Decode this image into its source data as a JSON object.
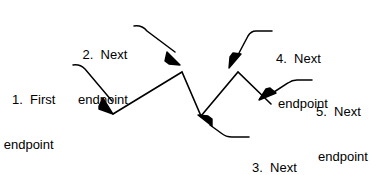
{
  "diagram": {
    "type": "polyline-construction-callout",
    "background_color": "#ffffff",
    "stroke_color": "#000000",
    "callouts": [
      {
        "id": "callout-1",
        "number": "1.",
        "line_a": "1.  First",
        "line_b": "endpoint",
        "full_text": "1. First endpoint",
        "target_vertex": "first-endpoint"
      },
      {
        "id": "callout-2",
        "number": "2.",
        "line_a": "2.  Next",
        "line_b": "endpoint",
        "full_text": "2. Next endpoint",
        "target_vertex": "second-endpoint"
      },
      {
        "id": "callout-3",
        "number": "3.",
        "line_a": "3.  Next",
        "line_b": "endpoint",
        "full_text": "3. Next endpoint",
        "target_vertex": "third-endpoint"
      },
      {
        "id": "callout-4",
        "number": "4.",
        "line_a": "4.  Next",
        "line_b": "endpoint",
        "full_text": "4. Next endpoint",
        "target_vertex": "fourth-endpoint"
      },
      {
        "id": "callout-5",
        "number": "5.",
        "line_a": "5.  Next",
        "line_b": "endpoint",
        "full_text": "5. Next endpoint",
        "target_vertex": "fifth-endpoint"
      }
    ],
    "polyline_vertices": [
      {
        "name": "first-endpoint",
        "x": 113,
        "y": 114
      },
      {
        "name": "second-endpoint",
        "x": 182,
        "y": 72
      },
      {
        "name": "third-endpoint",
        "x": 201,
        "y": 116
      },
      {
        "name": "fourth-endpoint",
        "x": 238,
        "y": 72
      },
      {
        "name": "fifth-endpoint",
        "x": 271,
        "y": 104
      }
    ]
  }
}
